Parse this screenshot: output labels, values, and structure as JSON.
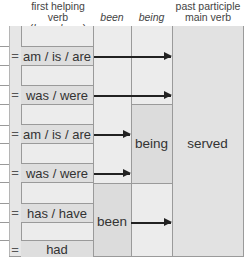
{
  "headers": {
    "first_helping_verb_line1": "first helping verb",
    "first_helping_verb_line2_a": "be",
    "first_helping_verb_line2_or": " or ",
    "first_helping_verb_line2_b": "have",
    "been": "been",
    "being": "being",
    "past_participle_line1": "past participle",
    "past_participle_line2": "main verb"
  },
  "rows": [
    {
      "eq": "=",
      "verb": "am / is / are"
    },
    {
      "eq": "=",
      "verb": "was / were"
    },
    {
      "eq": "=",
      "verb": "am / is / are"
    },
    {
      "eq": "=",
      "verb": "was / were"
    },
    {
      "eq": "=",
      "verb": "has / have"
    },
    {
      "eq": "=",
      "verb": "had"
    }
  ],
  "blocks": {
    "being": "being",
    "been": "been",
    "main_verb": "served"
  },
  "colors": {
    "background": "#ffffff",
    "column_fill": "#ececec",
    "cell_fill": "#dedede",
    "grid_line": "#9a9a9a",
    "arrow": "#222222"
  }
}
